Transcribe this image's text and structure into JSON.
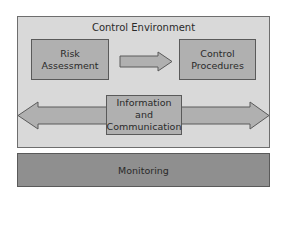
{
  "diagram": {
    "container": {
      "label": "Control Environment"
    },
    "nodes": [
      {
        "id": "risk",
        "line1": "Risk",
        "line2": "Assessment"
      },
      {
        "id": "control",
        "line1": "Control",
        "line2": "Procedures"
      },
      {
        "id": "info",
        "line1": "Information and",
        "line2": "Communication"
      }
    ],
    "footer": {
      "label": "Monitoring"
    },
    "edges": [
      {
        "from": "Risk Assessment",
        "to": "Control Procedures",
        "type": "single-arrow"
      },
      {
        "from": "Information and Communication",
        "to": "left and right edges",
        "type": "double-arrow"
      }
    ],
    "colors": {
      "environment_fill": "#d9d9d9",
      "box_fill": "#b0b0b0",
      "monitoring_fill": "#8f8f8f",
      "border": "#5a5a5a"
    }
  }
}
